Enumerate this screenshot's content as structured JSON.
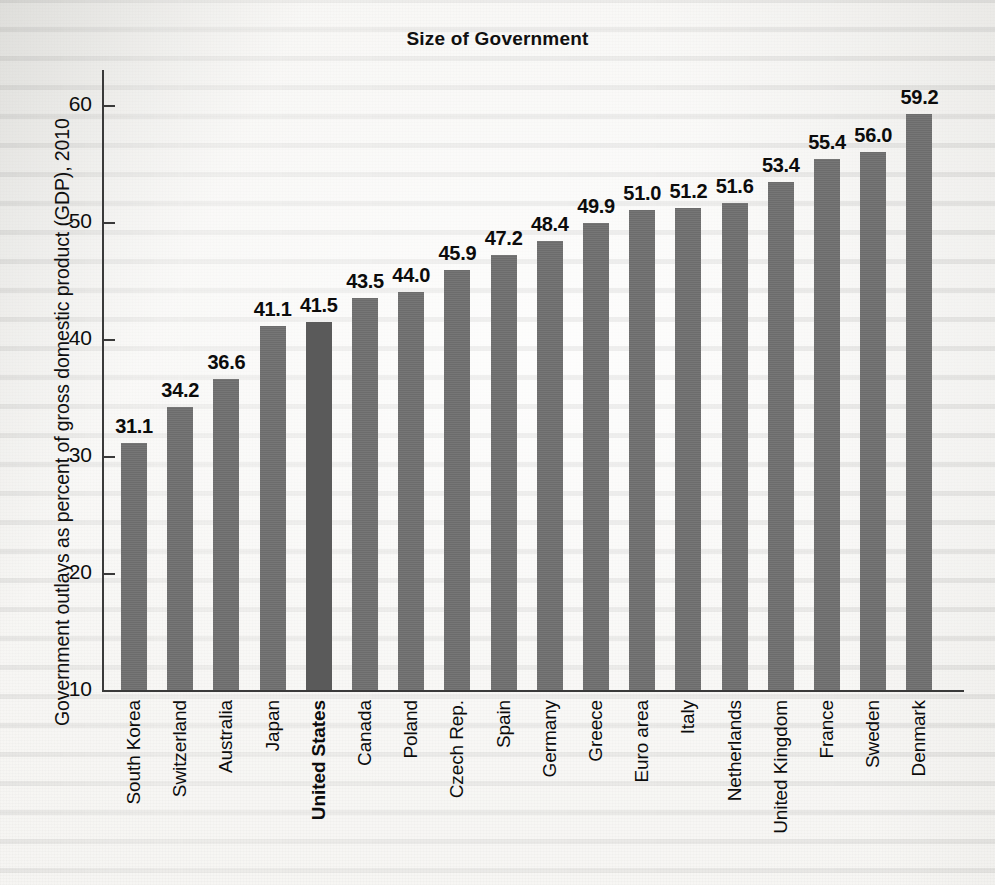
{
  "chart_data": {
    "type": "bar",
    "title": "Size of Government",
    "xlabel": "",
    "ylabel": "Government outlays as percent of gross domestic product (GDP), 2010",
    "ylim": [
      10,
      63
    ],
    "yticks": [
      10,
      20,
      30,
      40,
      50,
      60
    ],
    "ytick_labels": [
      "10",
      "20",
      "30",
      "40",
      "50",
      "60"
    ],
    "grid": false,
    "legend": null,
    "bar_color": "#6f6f6f",
    "highlight_color": "#5a5a5a",
    "highlight_category": "United States",
    "categories": [
      "South Korea",
      "Switzerland",
      "Australia",
      "Japan",
      "United States",
      "Canada",
      "Poland",
      "Czech Rep.",
      "Spain",
      "Germany",
      "Greece",
      "Euro area",
      "Italy",
      "Netherlands",
      "United Kingdom",
      "France",
      "Sweden",
      "Denmark"
    ],
    "values": [
      31.1,
      34.2,
      36.6,
      41.1,
      41.5,
      43.5,
      44.0,
      45.9,
      47.2,
      48.4,
      49.9,
      51.0,
      51.2,
      51.6,
      53.4,
      55.4,
      56.0,
      59.2
    ],
    "value_labels": [
      "31.1",
      "34.2",
      "36.6",
      "41.1",
      "41.5",
      "43.5",
      "44.0",
      "45.9",
      "47.2",
      "48.4",
      "49.9",
      "51.0",
      "51.2",
      "51.6",
      "53.4",
      "55.4",
      "56.0",
      "59.2"
    ]
  }
}
